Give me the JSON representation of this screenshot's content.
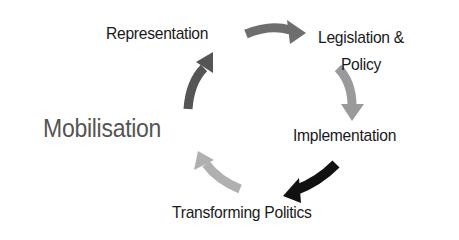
{
  "diagram": {
    "type": "cycle",
    "center_label": "Mobilisation",
    "stages": [
      {
        "id": "representation",
        "label": "Representation"
      },
      {
        "id": "legislation",
        "label": "Legislation &",
        "label2": "Policy"
      },
      {
        "id": "implementation",
        "label": "Implementation"
      },
      {
        "id": "transforming",
        "label": "Transforming Politics"
      }
    ],
    "arrows": [
      {
        "from": "representation",
        "to": "legislation",
        "color": "#6e6e6e"
      },
      {
        "from": "legislation",
        "to": "implementation",
        "color": "#9a9a9a"
      },
      {
        "from": "implementation",
        "to": "transforming",
        "color": "#111111"
      },
      {
        "from": "transforming",
        "to": "mobilisation",
        "color": "#b0b0b0"
      },
      {
        "from": "mobilisation",
        "to": "representation",
        "color": "#555555"
      }
    ]
  }
}
